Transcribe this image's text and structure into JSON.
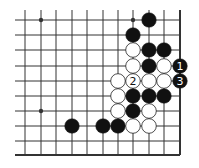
{
  "diagram": {
    "type": "go-board-fragment",
    "columns_x": [
      25,
      41,
      56,
      72,
      87,
      103,
      118,
      133,
      149,
      164,
      180
    ],
    "rows_y": [
      20,
      35,
      50,
      66,
      81,
      96,
      111,
      126,
      141,
      155
    ],
    "edges": {
      "right": true,
      "bottom": true
    },
    "star_points": [
      {
        "col": 1,
        "row": 0
      },
      {
        "col": 7,
        "row": 0
      },
      {
        "col": 1,
        "row": 6
      }
    ],
    "stones": [
      {
        "col": 8,
        "row": 0,
        "color": "black",
        "label": ""
      },
      {
        "col": 7,
        "row": 1,
        "color": "black",
        "label": ""
      },
      {
        "col": 7,
        "row": 2,
        "color": "white",
        "label": ""
      },
      {
        "col": 8,
        "row": 2,
        "color": "black",
        "label": ""
      },
      {
        "col": 9,
        "row": 2,
        "color": "black",
        "label": ""
      },
      {
        "col": 7,
        "row": 3,
        "color": "white",
        "label": ""
      },
      {
        "col": 8,
        "row": 3,
        "color": "black",
        "label": ""
      },
      {
        "col": 9,
        "row": 3,
        "color": "white",
        "label": ""
      },
      {
        "col": 10,
        "row": 3,
        "color": "black",
        "label": "1"
      },
      {
        "col": 6,
        "row": 4,
        "color": "white",
        "label": ""
      },
      {
        "col": 7,
        "row": 4,
        "color": "white",
        "label": "2"
      },
      {
        "col": 8,
        "row": 4,
        "color": "white",
        "label": ""
      },
      {
        "col": 9,
        "row": 4,
        "color": "white",
        "label": ""
      },
      {
        "col": 10,
        "row": 4,
        "color": "black",
        "label": "3"
      },
      {
        "col": 6,
        "row": 5,
        "color": "white",
        "label": ""
      },
      {
        "col": 7,
        "row": 5,
        "color": "black",
        "label": ""
      },
      {
        "col": 8,
        "row": 5,
        "color": "black",
        "label": ""
      },
      {
        "col": 9,
        "row": 5,
        "color": "black",
        "label": ""
      },
      {
        "col": 6,
        "row": 6,
        "color": "white",
        "label": ""
      },
      {
        "col": 7,
        "row": 6,
        "color": "black",
        "label": ""
      },
      {
        "col": 8,
        "row": 6,
        "color": "white",
        "label": ""
      },
      {
        "col": 3,
        "row": 7,
        "color": "black",
        "label": ""
      },
      {
        "col": 5,
        "row": 7,
        "color": "black",
        "label": ""
      },
      {
        "col": 6,
        "row": 7,
        "color": "black",
        "label": ""
      },
      {
        "col": 7,
        "row": 7,
        "color": "white",
        "label": ""
      },
      {
        "col": 8,
        "row": 7,
        "color": "white",
        "label": ""
      }
    ],
    "colors": {
      "line": "#333333",
      "black_stone": "#111111",
      "white_stone": "#ffffff",
      "stone_outline": "#222222"
    }
  }
}
